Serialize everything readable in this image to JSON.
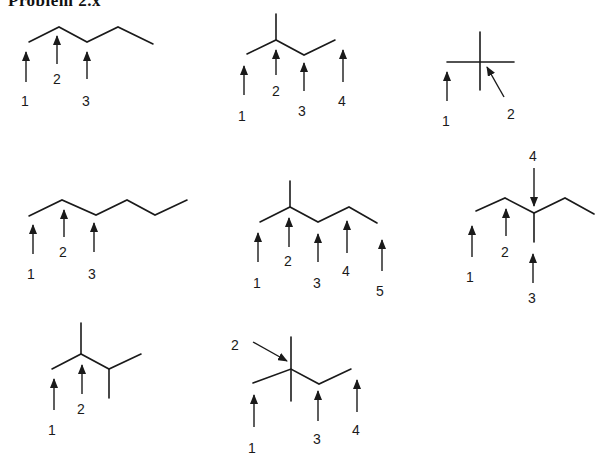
{
  "header": {
    "title": "Problem 2.x"
  },
  "structures": [
    {
      "id": "s1",
      "name": "hexane skeleton",
      "labels": [
        "1",
        "2",
        "3"
      ]
    },
    {
      "id": "s2",
      "name": "2-methylpentane skeleton",
      "labels": [
        "1",
        "2",
        "3",
        "4"
      ]
    },
    {
      "id": "s3",
      "name": "2,2-dimethylpropane skeleton",
      "labels": [
        "1",
        "2"
      ]
    },
    {
      "id": "s4",
      "name": "heptane skeleton",
      "labels": [
        "1",
        "2",
        "3"
      ]
    },
    {
      "id": "s5",
      "name": "2-methylhexane skeleton",
      "labels": [
        "1",
        "2",
        "3",
        "4",
        "5"
      ]
    },
    {
      "id": "s6",
      "name": "3-methylhexane skeleton",
      "labels": [
        "1",
        "2",
        "3",
        "4"
      ]
    },
    {
      "id": "s7",
      "name": "2,3-dimethylbutane skeleton",
      "labels": [
        "1",
        "2"
      ]
    },
    {
      "id": "s8",
      "name": "2,2-dimethylbutane skeleton",
      "labels": [
        "1",
        "2",
        "3",
        "4"
      ]
    }
  ]
}
